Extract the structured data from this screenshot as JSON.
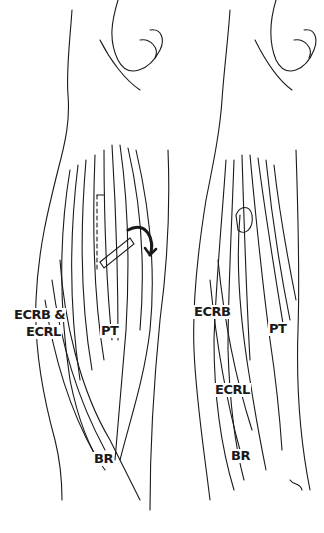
{
  "figure": {
    "type": "anatomical-illustration",
    "panels": [
      {
        "id": "left",
        "description": "Forearm with tendon transfer, curved arrow indicating rerouting",
        "labels": [
          {
            "text": "ECRB &",
            "x": 13,
            "y": 320
          },
          {
            "text": "ECRL",
            "x": 25,
            "y": 337
          },
          {
            "text": "PT",
            "x": 100,
            "y": 336
          },
          {
            "text": "BR",
            "x": 93,
            "y": 464
          }
        ]
      },
      {
        "id": "right",
        "description": "Forearm after transfer",
        "labels": [
          {
            "text": "ECRB",
            "x": 193,
            "y": 317
          },
          {
            "text": "PT",
            "x": 268,
            "y": 334
          },
          {
            "text": "ECRL",
            "x": 214,
            "y": 395
          },
          {
            "text": "BR",
            "x": 230,
            "y": 461
          }
        ]
      }
    ],
    "stroke_color": "#1a1a1a",
    "background": "#ffffff"
  }
}
